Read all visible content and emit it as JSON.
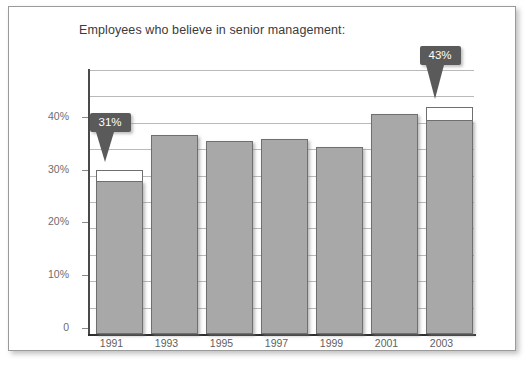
{
  "chart": {
    "title": "Employees who believe in senior management:",
    "bar_color": "#a8a8a8",
    "bar_border_color": "#6f6f6f",
    "cap_color": "#ffffff",
    "callout_bg": "#5a5a5a",
    "callout_fg": "#ffffff",
    "grid_color": "#b9b9b9",
    "axis_color": "#2e2e2e",
    "frame_color": "#9a9a9a"
  },
  "yaxis": {
    "labels": [
      "40%",
      "30%",
      "20%",
      "10%",
      "0"
    ],
    "values": [
      40,
      30,
      20,
      10,
      0
    ]
  },
  "xaxis": {
    "labels": [
      "1991",
      "1993",
      "1995",
      "1997",
      "1999",
      "2001",
      "2003"
    ]
  },
  "callouts": [
    {
      "label": "31%",
      "category": "1991"
    },
    {
      "label": "43%",
      "category": "2003"
    }
  ],
  "chart_data": {
    "type": "bar",
    "title": "Employees who believe in senior management:",
    "xlabel": "",
    "ylabel": "",
    "ylim": [
      0,
      50
    ],
    "grid": true,
    "gridline_step": 5,
    "legend": "none",
    "categories": [
      "1991",
      "1993",
      "1995",
      "1997",
      "1999",
      "2001",
      "2003"
    ],
    "values": [
      31,
      37.7,
      36.5,
      37,
      35.5,
      41.7,
      43
    ],
    "bar_segments": [
      {
        "category": "1991",
        "filled": 29,
        "highlight_top": 31
      },
      {
        "category": "1993",
        "filled": 37.7,
        "highlight_top": 37.7
      },
      {
        "category": "1995",
        "filled": 36.5,
        "highlight_top": 36.5
      },
      {
        "category": "1997",
        "filled": 37.0,
        "highlight_top": 37.0
      },
      {
        "category": "1999",
        "filled": 35.5,
        "highlight_top": 35.5
      },
      {
        "category": "2001",
        "filled": 41.7,
        "highlight_top": 41.7
      },
      {
        "category": "2003",
        "filled": 40.5,
        "highlight_top": 43
      }
    ],
    "annotations": [
      {
        "text": "31%",
        "category": "1991",
        "value": 31
      },
      {
        "text": "43%",
        "category": "2003",
        "value": 43
      }
    ],
    "ytick_labels": [
      "0",
      "10%",
      "20%",
      "30%",
      "40%"
    ],
    "ytick_values": [
      0,
      10,
      20,
      30,
      40
    ]
  }
}
